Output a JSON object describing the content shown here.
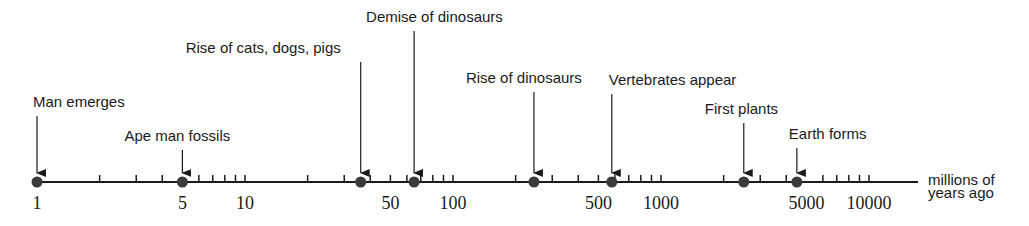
{
  "chart_data": {
    "type": "timeline",
    "scale": "log",
    "axis_label": [
      "millions of",
      "years ago"
    ],
    "xlim": [
      1,
      10000
    ],
    "major_ticks": [
      {
        "value": 1,
        "label": "1"
      },
      {
        "value": 5,
        "label": "5"
      },
      {
        "value": 10,
        "label": "10"
      },
      {
        "value": 50,
        "label": "50"
      },
      {
        "value": 100,
        "label": "100"
      },
      {
        "value": 500,
        "label": "500"
      },
      {
        "value": 1000,
        "label": "1000"
      },
      {
        "value": 5000,
        "label": "5000"
      },
      {
        "value": 10000,
        "label": "10000"
      }
    ],
    "minor_ticks": [
      2,
      3,
      4,
      6,
      7,
      8,
      9,
      10,
      20,
      30,
      40,
      50,
      60,
      70,
      80,
      90,
      100,
      200,
      300,
      400,
      500,
      600,
      700,
      800,
      900,
      1000,
      2000,
      3000,
      4000,
      6000,
      7000,
      8000,
      9000,
      10000
    ],
    "events": [
      {
        "label": "Man emerges",
        "value": 1
      },
      {
        "label": "Ape man fossils",
        "value": 5
      },
      {
        "label": "Rise of cats, dogs, pigs",
        "value": 36
      },
      {
        "label": "Demise of dinosaurs",
        "value": 65
      },
      {
        "label": "Rise of dinosaurs",
        "value": 245
      },
      {
        "label": "Vertebrates appear",
        "value": 580
      },
      {
        "label": "First plants",
        "value": 2500
      },
      {
        "label": "Earth forms",
        "value": 4500
      }
    ]
  },
  "layout": {
    "x0": 37,
    "decade_px": 208,
    "axis_y": 182,
    "axis_end": 918,
    "label_y": [
      107,
      141,
      53,
      22,
      83,
      85,
      114,
      139
    ],
    "label_offset": [
      -4,
      -58,
      -175,
      -48,
      -68,
      -3,
      -39,
      -8
    ]
  },
  "colors": {
    "ink": "#1a1a1a",
    "dot": "#3a3a3a"
  }
}
